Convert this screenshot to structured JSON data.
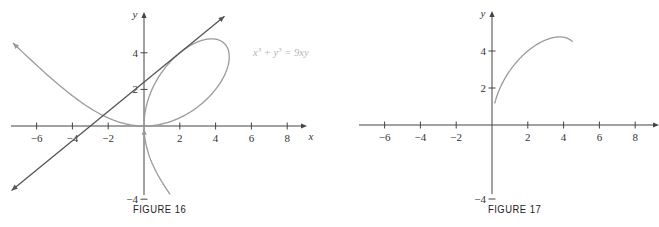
{
  "chart_data": [
    {
      "type": "line",
      "title": "FIGURE 16",
      "xlabel": "x",
      "ylabel": "y",
      "xlim": [
        -7.5,
        9
      ],
      "ylim": [
        -6,
        6.3
      ],
      "x_ticks": [
        -6,
        -4,
        -2,
        2,
        4,
        6,
        8
      ],
      "y_ticks": [
        4,
        2,
        -4
      ],
      "x_tick_labels": [
        "−6",
        "−4",
        "−2",
        "2",
        "4",
        "6",
        "8"
      ],
      "y_tick_labels": [
        "4",
        "2",
        "−4"
      ],
      "grid": false,
      "annotations": [
        {
          "text": "x³ + y³ = 9xy",
          "x": 6.2,
          "y": 4.2
        }
      ],
      "series": [
        {
          "name": "Folium of Descartes x³ + y³ = 9xy",
          "kind": "implicit curve",
          "color": "#9a9a9a",
          "parametric": "x = 9t/(1+t³), y = 9t²/(1+t³)",
          "points": [
            [
              -7.2,
              4.3
            ],
            [
              -4,
              1.6
            ],
            [
              -2,
              0.42
            ],
            [
              0,
              0
            ],
            [
              2,
              0.52
            ],
            [
              4,
              2.2
            ],
            [
              4.7,
              3.6
            ],
            [
              4,
              4.7
            ],
            [
              3.5,
              4.75
            ],
            [
              2,
              4
            ],
            [
              0.5,
              2
            ],
            [
              0,
              0
            ],
            [
              0.4,
              -2.5
            ],
            [
              1.3,
              -5.5
            ]
          ]
        },
        {
          "name": "Tangent line at (2, 4)",
          "kind": "line",
          "color": "#555555",
          "slope": 0.8,
          "intercept": 2.4,
          "x_range": [
            -7.4,
            4.5
          ]
        }
      ]
    },
    {
      "type": "line",
      "title": "FIGURE 17",
      "xlabel": "x",
      "ylabel": "y",
      "xlim": [
        -7.5,
        9
      ],
      "ylim": [
        -6,
        6.3
      ],
      "x_ticks": [
        -6,
        -4,
        -2,
        2,
        4,
        6,
        8
      ],
      "y_ticks": [
        4,
        2,
        -4
      ],
      "x_tick_labels": [
        "−6",
        "−4",
        "−2",
        "2",
        "4",
        "6",
        "8"
      ],
      "y_tick_labels": [
        "4",
        "2",
        "−4"
      ],
      "grid": false,
      "series": [
        {
          "name": "Upper branch of folium (function portion)",
          "kind": "curve",
          "color": "#9a9a9a",
          "points": [
            [
              0.15,
              1.2
            ],
            [
              0.5,
              2.1
            ],
            [
              1,
              2.9
            ],
            [
              2,
              4
            ],
            [
              3,
              4.6
            ],
            [
              3.8,
              4.76
            ],
            [
              4.3,
              4.6
            ],
            [
              4.6,
              4.3
            ]
          ]
        }
      ]
    }
  ],
  "figures": {
    "fig16": {
      "caption": "FIGURE 16",
      "equation": "x³ + y³ = 9xy",
      "x_axis_label": "x",
      "y_axis_label": "y"
    },
    "fig17": {
      "caption": "FIGURE 17",
      "x_axis_label": "x",
      "y_axis_label": "y"
    }
  },
  "colors": {
    "axis": "#444444",
    "curve": "#9a9a9a",
    "tangent": "#555555",
    "equation": "#b5b5b5"
  }
}
